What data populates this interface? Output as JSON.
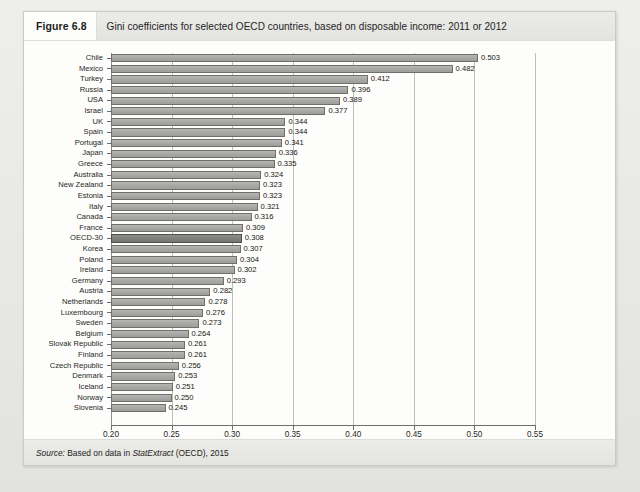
{
  "figure": {
    "number": "Figure 6.8",
    "title": "Gini coefficients for selected OECD countries, based on disposable income: 2011 or 2012",
    "source_prefix": "Source:",
    "source_body": "Based on data in",
    "source_italic": "StatExtract",
    "source_suffix": "(OECD), 2015"
  },
  "colors": {
    "bar_fill": "#a9a9a7",
    "bar_border": "#6f6f6d",
    "bar_highlight_fill": "#808080",
    "bar_highlight_border": "#4f4f4d",
    "gridline": "#bdbdba",
    "axis": "#6e6e6b",
    "panel_background": "#fdfdfc",
    "header_band": "#e9e9e6"
  },
  "chart_data": {
    "type": "bar",
    "orientation": "horizontal",
    "title": "Gini coefficients for selected OECD countries, based on disposable income: 2011 or 2012",
    "xlabel": "",
    "ylabel": "",
    "xlim": [
      0.2,
      0.55
    ],
    "xticks": [
      "0.20",
      "0.25",
      "0.30",
      "0.35",
      "0.40",
      "0.45",
      "0.50",
      "0.55"
    ],
    "xtick_values": [
      0.2,
      0.25,
      0.3,
      0.35,
      0.4,
      0.45,
      0.5,
      0.55
    ],
    "grid": true,
    "legend": "none",
    "highlight_category": "OECD-30",
    "categories": [
      "Chile",
      "Mexico",
      "Turkey",
      "Russia",
      "USA",
      "Israel",
      "UK",
      "Spain",
      "Portugal",
      "Japan",
      "Greece",
      "Australia",
      "New Zealand",
      "Estonia",
      "Italy",
      "Canada",
      "France",
      "OECD-30",
      "Korea",
      "Poland",
      "Ireland",
      "Germany",
      "Austria",
      "Netherlands",
      "Luxembourg",
      "Sweden",
      "Belgium",
      "Slovak Republic",
      "Finland",
      "Czech Republic",
      "Denmark",
      "Iceland",
      "Norway",
      "Slovenia"
    ],
    "values": [
      0.503,
      0.482,
      0.412,
      0.396,
      0.389,
      0.377,
      0.344,
      0.344,
      0.341,
      0.336,
      0.335,
      0.324,
      0.323,
      0.323,
      0.321,
      0.316,
      0.309,
      0.308,
      0.307,
      0.304,
      0.302,
      0.293,
      0.282,
      0.278,
      0.276,
      0.273,
      0.264,
      0.261,
      0.261,
      0.256,
      0.253,
      0.251,
      0.25,
      0.245
    ],
    "value_labels": [
      "0.503",
      "0.482",
      "0.412",
      "0.396",
      "0.389",
      "0.377",
      "0.344",
      "0.344",
      "0.341",
      "0.336",
      "0.335",
      "0.324",
      "0.323",
      "0.323",
      "0.321",
      "0.316",
      "0.309",
      "0.308",
      "0.307",
      "0.304",
      "0.302",
      "0.293",
      "0.282",
      "0.278",
      "0.276",
      "0.273",
      "0.264",
      "0.261",
      "0.261",
      "0.256",
      "0.253",
      "0.251",
      "0.250",
      "0.245"
    ]
  }
}
